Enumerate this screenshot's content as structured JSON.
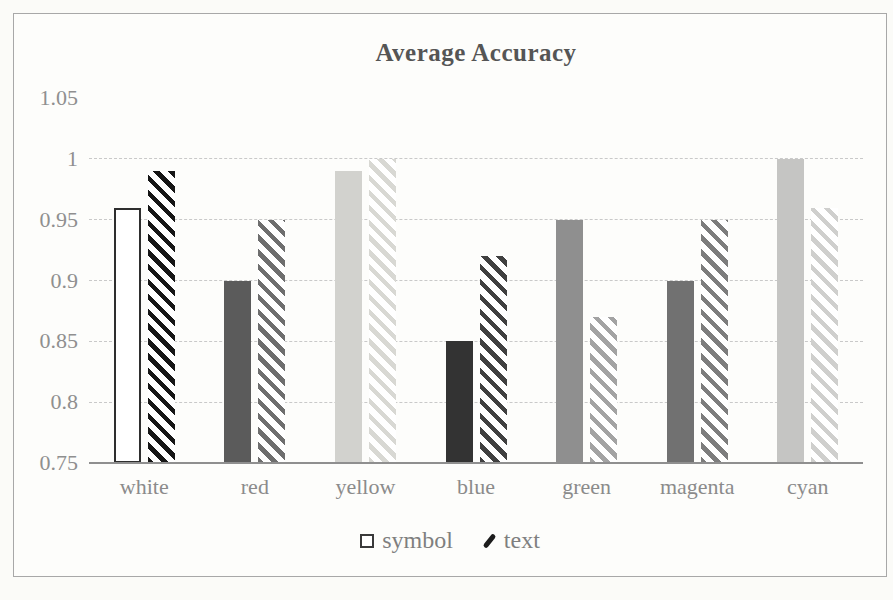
{
  "chart_data": {
    "type": "bar",
    "title": "Average Accuracy",
    "categories": [
      "white",
      "red",
      "yellow",
      "blue",
      "green",
      "magenta",
      "cyan"
    ],
    "series": [
      {
        "name": "symbol",
        "fill_style": "solid",
        "values": [
          0.96,
          0.9,
          0.99,
          0.85,
          0.95,
          0.9,
          1.0
        ],
        "bar_colors": [
          "#ffffff",
          "#5b5b5b",
          "#d2d2ce",
          "#333333",
          "#8f8f8f",
          "#717171",
          "#c5c5c3"
        ],
        "bar_strokes": [
          "#2e2e2e",
          "",
          "",
          "",
          "",
          "",
          ""
        ]
      },
      {
        "name": "text",
        "fill_style": "diagonal-hatch",
        "values": [
          0.99,
          0.95,
          1.0,
          0.92,
          0.87,
          0.95,
          0.96
        ],
        "bar_colors": [
          "#161616",
          "#6e6e6e",
          "#d8d8d3",
          "#404040",
          "#a3a3a3",
          "#7d7d7d",
          "#cfcfcd"
        ]
      }
    ],
    "ylim": [
      0.75,
      1.05
    ],
    "yticks": [
      {
        "label": "1.05",
        "value": 1.05
      },
      {
        "label": "1",
        "value": 1.0
      },
      {
        "label": "0.95",
        "value": 0.95
      },
      {
        "label": "0.9",
        "value": 0.9
      },
      {
        "label": "0.85",
        "value": 0.85
      },
      {
        "label": "0.8",
        "value": 0.8
      },
      {
        "label": "0.75",
        "value": 0.75
      }
    ],
    "gridlines": [
      1.0,
      0.95,
      0.9,
      0.85,
      0.8
    ],
    "legend_position": "bottom",
    "grid_on": true,
    "colors": {
      "grid": "#c9c9c9",
      "axis": "#8f8f8f",
      "tick_text": "#8f8f8f",
      "title_text": "#555555",
      "legend_text": "#7f7f7f",
      "figure_border": "#a8a8a8",
      "paper": "#fbfbf8",
      "hatch_bg": "#ffffff"
    }
  }
}
